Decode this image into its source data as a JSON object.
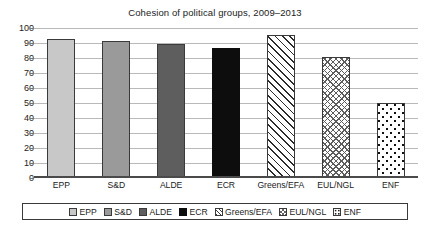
{
  "chart_data": {
    "type": "bar",
    "title": "Cohesion of political groups, 2009–2013",
    "xlabel": "",
    "ylabel": "",
    "ylim": [
      0,
      100
    ],
    "yticks": [
      0,
      10,
      20,
      30,
      40,
      50,
      60,
      70,
      80,
      90,
      100
    ],
    "grid": true,
    "legend_position": "bottom",
    "categories": [
      "EPP",
      "S&D",
      "ALDE",
      "ECR",
      "Greens/EFA",
      "EUL/NGL",
      "ENF"
    ],
    "values": [
      92.5,
      91.5,
      89.5,
      87,
      95.5,
      80.5,
      50
    ],
    "series": [
      {
        "name": "Cohesion",
        "values": [
          92.5,
          91.5,
          89.5,
          87,
          95.5,
          80.5,
          50
        ]
      }
    ],
    "points": [
      {
        "category": "EPP",
        "value": 92.5,
        "fill": "light-gray",
        "color": "#c8c8c8"
      },
      {
        "category": "S&D",
        "value": 91.5,
        "fill": "medium-gray",
        "color": "#9a9a9a"
      },
      {
        "category": "ALDE",
        "value": 89.5,
        "fill": "dark-gray",
        "color": "#5e5e5e"
      },
      {
        "category": "ECR",
        "value": 87,
        "fill": "black",
        "color": "#0d0d0d"
      },
      {
        "category": "Greens/EFA",
        "value": 95.5,
        "fill": "diagonal-hatch",
        "color": "#2b2b2b"
      },
      {
        "category": "EUL/NGL",
        "value": 80.5,
        "fill": "cross-hatch",
        "color": "#5c5c5c"
      },
      {
        "category": "ENF",
        "value": 50,
        "fill": "dotted",
        "color": "#111111"
      }
    ],
    "legend": [
      {
        "label": "EPP",
        "fill": "light-gray"
      },
      {
        "label": "S&D",
        "fill": "medium-gray"
      },
      {
        "label": "ALDE",
        "fill": "dark-gray"
      },
      {
        "label": "ECR",
        "fill": "black"
      },
      {
        "label": "Greens/EFA",
        "fill": "diagonal-hatch"
      },
      {
        "label": "EUL/NGL",
        "fill": "cross-hatch"
      },
      {
        "label": "ENF",
        "fill": "dotted"
      }
    ]
  }
}
